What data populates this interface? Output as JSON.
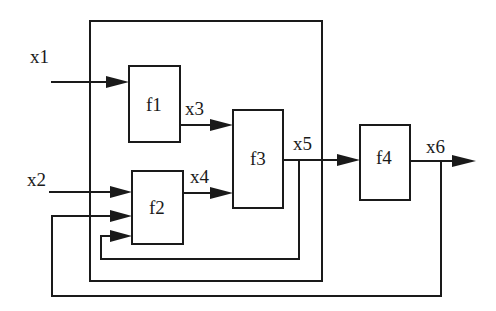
{
  "diagram": {
    "type": "block-diagram",
    "colors": {
      "stroke": "#1a1a1a",
      "background": "#ffffff"
    },
    "blocks": [
      {
        "id": "f1",
        "label": "f1"
      },
      {
        "id": "f2",
        "label": "f2"
      },
      {
        "id": "f3",
        "label": "f3"
      },
      {
        "id": "f4",
        "label": "f4"
      }
    ],
    "signals": [
      {
        "id": "x1",
        "label": "x1",
        "from": "input",
        "to": "f1"
      },
      {
        "id": "x2",
        "label": "x2",
        "from": "input",
        "to": "f2"
      },
      {
        "id": "x3",
        "label": "x3",
        "from": "f1",
        "to": "f3"
      },
      {
        "id": "x4",
        "label": "x4",
        "from": "f2",
        "to": "f3"
      },
      {
        "id": "x5",
        "label": "x5",
        "from": "f3",
        "to": "f4"
      },
      {
        "id": "x6",
        "label": "x6",
        "from": "f4",
        "to": "output"
      }
    ],
    "feedback": [
      {
        "from": "x5",
        "to": "f2",
        "note": "inner loop from x5 back to f2 (third input)"
      },
      {
        "from": "x6",
        "to": "f2",
        "note": "outer loop from x6 back to f2 (second input)"
      }
    ],
    "enclosure": {
      "contains": [
        "f1",
        "f2",
        "f3"
      ]
    }
  }
}
